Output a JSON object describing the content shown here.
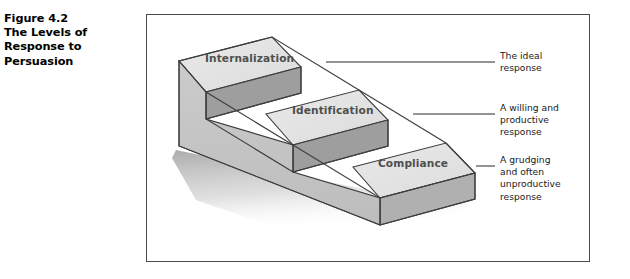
{
  "caption": {
    "lines": [
      "Figure 4.2",
      "The Levels of",
      "Response to",
      "Persuasion"
    ]
  },
  "figure": {
    "steps": [
      {
        "id": "internalization",
        "label": "Internalization",
        "level": 3
      },
      {
        "id": "identification",
        "label": "Identification",
        "level": 2
      },
      {
        "id": "compliance",
        "label": "Compliance",
        "level": 1
      }
    ],
    "annotations": [
      {
        "id": "ideal",
        "lines": [
          "The ideal",
          "response"
        ]
      },
      {
        "id": "willing",
        "lines": [
          "A willing and",
          "productive",
          "response"
        ]
      },
      {
        "id": "grudging",
        "lines": [
          "A grudging",
          "and often",
          "unproductive",
          "response"
        ]
      }
    ]
  },
  "colors": {
    "top_face": "#e4e4e4",
    "front_face": "#c3c3c3",
    "riser_face": "#9e9e9e",
    "right_face": "#b0b0b0",
    "outline": "#3d3d3d",
    "frame": "#4a4a4a",
    "label_text": "#4f4f4f",
    "body_text": "#1a1a1a",
    "shadow": "#b9b9b9"
  }
}
